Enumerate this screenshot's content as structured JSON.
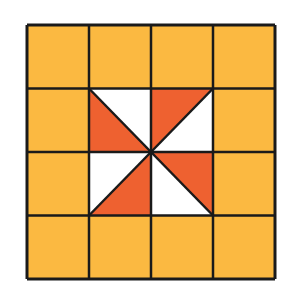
{
  "diagram": {
    "type": "quilt-grid",
    "rows": 4,
    "cols": 4,
    "origin": [
      27,
      25
    ],
    "cell_width": 62,
    "cell_height": 63.5,
    "colors": {
      "background": "#ffffff",
      "fill": "#FBB941",
      "accent": "#EE6130",
      "light": "#ffffff",
      "line": "#1a1a1a"
    },
    "line_width": 2.5,
    "pinwheel_cells": [
      {
        "row": 1,
        "col": 1,
        "orange": "bottom-left",
        "diagonal": "tl-br"
      },
      {
        "row": 1,
        "col": 2,
        "orange": "top-left",
        "diagonal": "tr-bl"
      },
      {
        "row": 2,
        "col": 2,
        "orange": "top-right",
        "diagonal": "tl-br"
      },
      {
        "row": 2,
        "col": 1,
        "orange": "bottom-right",
        "diagonal": "tr-bl"
      }
    ]
  }
}
